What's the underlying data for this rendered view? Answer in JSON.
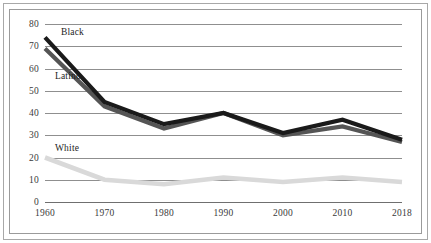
{
  "chart_data": {
    "type": "line",
    "title": "",
    "subtitle": "",
    "xlabel": "",
    "ylabel": "",
    "x": [
      1960,
      1970,
      1980,
      1990,
      2000,
      2010,
      2018
    ],
    "categories": [
      "1960",
      "1970",
      "1980",
      "1990",
      "2000",
      "2010",
      "2018"
    ],
    "xtick_labels": [
      "1960",
      "1970",
      "1980",
      "1990",
      "2000",
      "2010",
      "2018"
    ],
    "ytick_labels": [
      "0",
      "10",
      "20",
      "30",
      "40",
      "50",
      "60",
      "70",
      "80"
    ],
    "ytick_values": [
      0,
      10,
      20,
      30,
      40,
      50,
      60,
      70,
      80
    ],
    "ylim": [
      0,
      80
    ],
    "grid": "horizontal",
    "legend": "inline-labels",
    "series": [
      {
        "name": "Black",
        "label": "Black",
        "color": "#1a1a1a",
        "values": [
          74,
          45,
          35,
          40,
          31,
          37,
          28
        ]
      },
      {
        "name": "Latino",
        "label": "Latino",
        "color": "#555555",
        "values": [
          69,
          43,
          33,
          40,
          30,
          34,
          27
        ]
      },
      {
        "name": "White",
        "label": "White",
        "color": "#d9d9d9",
        "values": [
          20,
          10,
          8,
          11,
          9,
          11,
          9
        ]
      }
    ],
    "annotations": [
      {
        "text": "Black",
        "series": "Black",
        "x": 1962,
        "y": 76
      },
      {
        "text": "Latino",
        "series": "Latino",
        "x": 1961,
        "y": 56
      },
      {
        "text": "White",
        "series": "White",
        "x": 1961,
        "y": 24
      }
    ]
  },
  "colors": {
    "background": "#ffffff",
    "outer_frame": "#a8a8a8",
    "plot_frame": "#9b9b9b",
    "gridline": "#8f8f8f",
    "axis_line": "#6f6f6f",
    "tick_text": "#3a3a3a",
    "label_text": "#1d1d1d"
  }
}
